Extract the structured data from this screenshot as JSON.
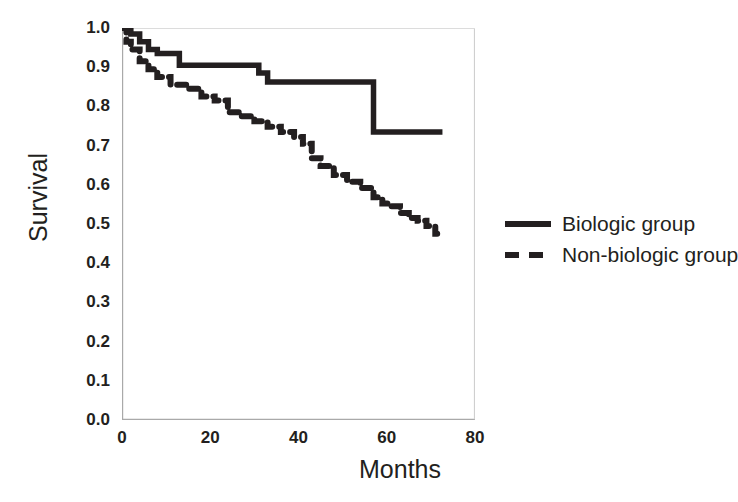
{
  "chart_data": {
    "type": "line",
    "title": "",
    "xlabel": "Months",
    "ylabel": "Survival",
    "xlim": [
      0,
      80
    ],
    "ylim": [
      0.0,
      1.0
    ],
    "xticks": [
      0,
      20,
      40,
      60,
      80
    ],
    "yticks": [
      "0.0",
      "0.1",
      "0.2",
      "0.3",
      "0.4",
      "0.5",
      "0.6",
      "0.7",
      "0.8",
      "0.9",
      "1.0"
    ],
    "grid": false,
    "legend_position": "right",
    "curve_style": "step",
    "series": [
      {
        "name": "Biologic group",
        "style": "solid",
        "color": "#231f20",
        "points": [
          [
            0,
            1.0
          ],
          [
            2,
            1.0
          ],
          [
            2,
            0.985
          ],
          [
            4,
            0.985
          ],
          [
            4,
            0.965
          ],
          [
            6,
            0.965
          ],
          [
            6,
            0.945
          ],
          [
            8,
            0.945
          ],
          [
            8,
            0.935
          ],
          [
            13,
            0.935
          ],
          [
            13,
            0.905
          ],
          [
            31,
            0.905
          ],
          [
            31,
            0.885
          ],
          [
            33,
            0.885
          ],
          [
            33,
            0.862
          ],
          [
            57,
            0.862
          ],
          [
            57,
            0.735
          ],
          [
            72,
            0.735
          ]
        ]
      },
      {
        "name": "Non-biologic group",
        "style": "dashed",
        "color": "#231f20",
        "points": [
          [
            0,
            1.0
          ],
          [
            1,
            1.0
          ],
          [
            1,
            0.965
          ],
          [
            2,
            0.965
          ],
          [
            2,
            0.945
          ],
          [
            4,
            0.945
          ],
          [
            4,
            0.915
          ],
          [
            6,
            0.915
          ],
          [
            6,
            0.895
          ],
          [
            8,
            0.895
          ],
          [
            8,
            0.875
          ],
          [
            11,
            0.875
          ],
          [
            11,
            0.855
          ],
          [
            15,
            0.855
          ],
          [
            15,
            0.845
          ],
          [
            18,
            0.845
          ],
          [
            18,
            0.825
          ],
          [
            21,
            0.825
          ],
          [
            21,
            0.815
          ],
          [
            24,
            0.815
          ],
          [
            24,
            0.785
          ],
          [
            27,
            0.785
          ],
          [
            27,
            0.775
          ],
          [
            30,
            0.775
          ],
          [
            30,
            0.762
          ],
          [
            33,
            0.762
          ],
          [
            33,
            0.748
          ],
          [
            36,
            0.748
          ],
          [
            36,
            0.735
          ],
          [
            39,
            0.735
          ],
          [
            39,
            0.722
          ],
          [
            41,
            0.722
          ],
          [
            41,
            0.705
          ],
          [
            43,
            0.705
          ],
          [
            43,
            0.668
          ],
          [
            45,
            0.668
          ],
          [
            45,
            0.648
          ],
          [
            48,
            0.648
          ],
          [
            48,
            0.625
          ],
          [
            51,
            0.625
          ],
          [
            51,
            0.608
          ],
          [
            54,
            0.608
          ],
          [
            54,
            0.592
          ],
          [
            57,
            0.592
          ],
          [
            57,
            0.568
          ],
          [
            59,
            0.568
          ],
          [
            59,
            0.552
          ],
          [
            61,
            0.552
          ],
          [
            61,
            0.545
          ],
          [
            63,
            0.545
          ],
          [
            63,
            0.528
          ],
          [
            65,
            0.528
          ],
          [
            65,
            0.515
          ],
          [
            67,
            0.515
          ],
          [
            67,
            0.508
          ],
          [
            69,
            0.508
          ],
          [
            69,
            0.495
          ],
          [
            71,
            0.495
          ],
          [
            71,
            0.475
          ],
          [
            72,
            0.475
          ]
        ]
      }
    ]
  },
  "legend": {
    "items": [
      {
        "label": "Biologic group",
        "style": "solid"
      },
      {
        "label": "Non-biologic group",
        "style": "dashed"
      }
    ]
  }
}
